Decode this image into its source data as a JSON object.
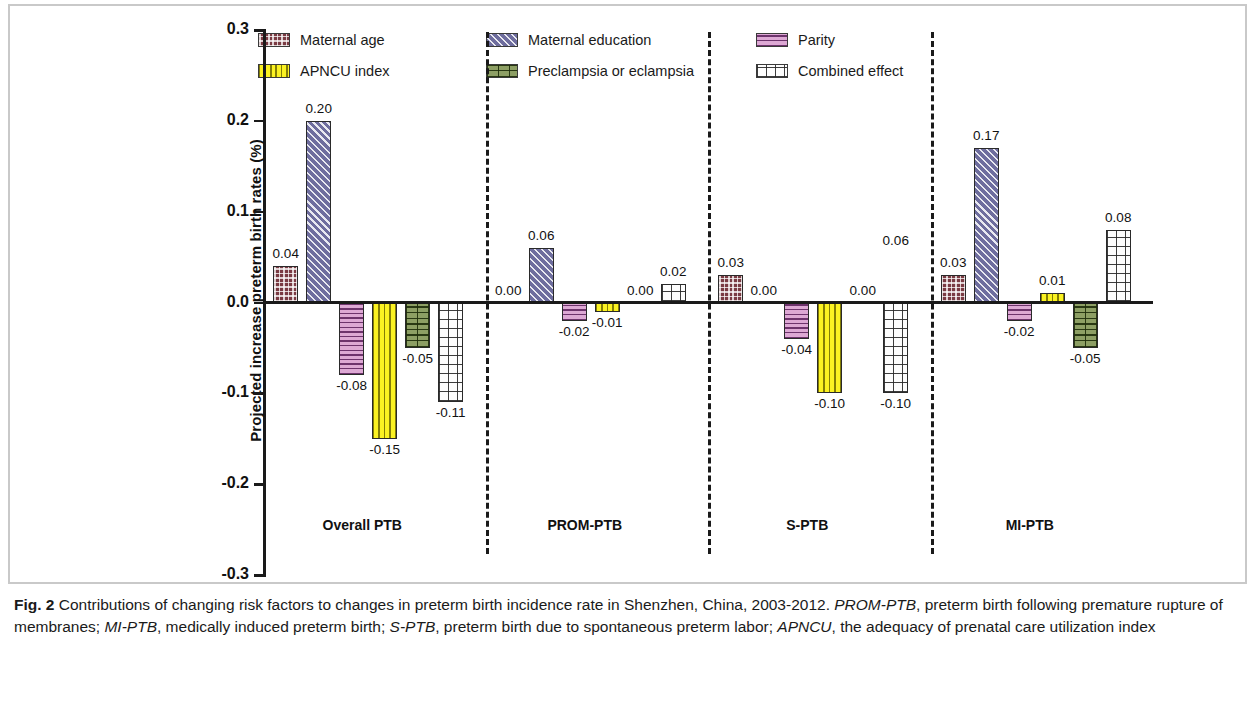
{
  "figure": {
    "label": "Fig. 2",
    "caption_parts": [
      {
        "text": "Fig. 2 ",
        "style": "bold"
      },
      {
        "text": "Contributions of changing risk factors to changes in preterm birth incidence rate in Shenzhen, China, 2003-2012. ",
        "style": "normal"
      },
      {
        "text": "PROM-PTB",
        "style": "italic"
      },
      {
        "text": ", preterm birth following premature rupture of membranes; ",
        "style": "normal"
      },
      {
        "text": "MI-PTB",
        "style": "italic"
      },
      {
        "text": ", medically induced preterm birth; ",
        "style": "normal"
      },
      {
        "text": "S-PTB",
        "style": "italic"
      },
      {
        "text": ", preterm birth due to spontaneous preterm labor; ",
        "style": "normal"
      },
      {
        "text": "APNCU",
        "style": "italic"
      },
      {
        "text": ", the adequacy of prenatal care utilization index",
        "style": "normal"
      }
    ]
  },
  "legend": {
    "entries": [
      {
        "label": "Maternal age",
        "pattern": "pat-maternal-age",
        "color": "#7a3b43"
      },
      {
        "label": "APNCU index",
        "pattern": "pat-apncu",
        "color": "#fbf222"
      },
      {
        "label": "Maternal education",
        "pattern": "pat-maternal-education",
        "color": "#6e6d9e"
      },
      {
        "label": "Preclampsia or eclampsia",
        "pattern": "pat-preclampsia",
        "color": "#8d9f64"
      },
      {
        "label": "Parity",
        "pattern": "pat-parity",
        "color": "#dda8d4"
      },
      {
        "label": "Combined effect",
        "pattern": "pat-combined",
        "color": "#fdfdfd"
      }
    ]
  },
  "chart_data": {
    "type": "bar",
    "title": "",
    "xlabel": "",
    "ylabel": "Projected increase preterm birth rates (%)",
    "ylim": [
      -0.3,
      0.3
    ],
    "ytick_labels": [
      "0.3",
      "0.2",
      "0.1",
      "0.0",
      "-0.1",
      "-0.2",
      "-0.3"
    ],
    "ytick_values": [
      0.3,
      0.2,
      0.1,
      0.0,
      -0.1,
      -0.2,
      -0.3
    ],
    "grid": false,
    "legend_position": "top",
    "categories": [
      "Overall PTB",
      "PROM-PTB",
      "S-PTB",
      "MI-PTB"
    ],
    "series": [
      {
        "name": "Maternal age",
        "pattern": "pat-maternal-age",
        "values": [
          0.04,
          0.0,
          0.03,
          0.03
        ],
        "labels": [
          "0.04",
          "0.00",
          "0.03",
          "0.03"
        ]
      },
      {
        "name": "Maternal education",
        "pattern": "pat-maternal-education",
        "values": [
          0.2,
          0.06,
          0.0,
          0.17
        ],
        "labels": [
          "0.20",
          "0.06",
          "0.00",
          "0.17"
        ]
      },
      {
        "name": "Parity",
        "pattern": "pat-parity",
        "values": [
          -0.08,
          -0.02,
          -0.04,
          -0.02
        ],
        "labels": [
          "-0.08",
          "-0.02",
          "-0.04",
          "-0.02"
        ]
      },
      {
        "name": "APNCU index",
        "pattern": "pat-apncu",
        "values": [
          -0.15,
          -0.01,
          -0.1,
          0.01
        ],
        "labels": [
          "-0.15",
          "-0.01",
          "-0.10",
          "0.01"
        ]
      },
      {
        "name": "Preclampsia or eclampsia",
        "pattern": "pat-preclampsia",
        "values": [
          -0.05,
          0.0,
          0.0,
          -0.05
        ],
        "labels": [
          "-0.05",
          "0.00",
          "0.00",
          "-0.05"
        ]
      },
      {
        "name": "Combined effect",
        "pattern": "pat-combined",
        "values": [
          -0.11,
          0.02,
          -0.1,
          0.08
        ],
        "labels": [
          "-0.11",
          "0.02",
          "-0.10",
          "0.08"
        ]
      }
    ],
    "annotations": [
      {
        "text": "0.06",
        "group": "S-PTB",
        "series": "Combined effect",
        "note": "floating label above S-PTB combined effect bar"
      }
    ]
  }
}
